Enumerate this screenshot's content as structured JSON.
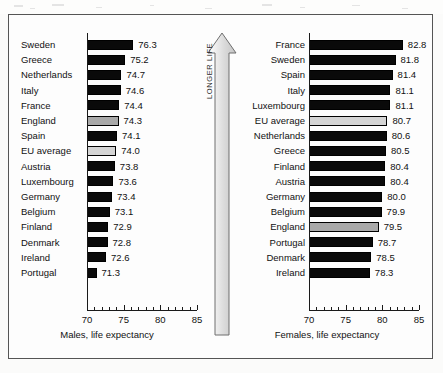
{
  "chart_data": [
    {
      "type": "bar",
      "orientation": "horizontal",
      "title": "",
      "xlabel": "Males, life expectancy",
      "ylabel": "",
      "xlim": [
        70,
        85
      ],
      "xticks": [
        70,
        75,
        80,
        85
      ],
      "minor_tick_step": 1,
      "grid": false,
      "legend": "none",
      "categories": [
        "Sweden",
        "Greece",
        "Netherlands",
        "Italy",
        "France",
        "England",
        "Spain",
        "EU average",
        "Austria",
        "Luxembourg",
        "Germany",
        "Belgium",
        "Finland",
        "Denmark",
        "Ireland",
        "Portugal"
      ],
      "values": [
        76.3,
        75.2,
        74.7,
        74.6,
        74.4,
        74.3,
        74.1,
        74.0,
        73.8,
        73.6,
        73.4,
        73.1,
        72.9,
        72.8,
        72.6,
        71.3
      ],
      "value_labels": [
        "76.3",
        "75.2",
        "74.7",
        "74.6",
        "74.4",
        "74.3",
        "74.1",
        "74.0",
        "73.8",
        "73.6",
        "73.4",
        "73.1",
        "72.9",
        "72.8",
        "72.6",
        "71.3"
      ],
      "highlights": {
        "England": "england",
        "EU average": "eu"
      }
    },
    {
      "type": "bar",
      "orientation": "horizontal",
      "title": "",
      "xlabel": "Females, life expectancy",
      "ylabel": "",
      "xlim": [
        70,
        85
      ],
      "xticks": [
        70,
        75,
        80,
        85
      ],
      "minor_tick_step": 1,
      "grid": false,
      "legend": "none",
      "categories": [
        "France",
        "Sweden",
        "Spain",
        "Italy",
        "Luxembourg",
        "EU average",
        "Netherlands",
        "Greece",
        "Finland",
        "Austria",
        "Germany",
        "Belgium",
        "England",
        "Portugal",
        "Denmark",
        "Ireland"
      ],
      "values": [
        82.8,
        81.8,
        81.4,
        81.1,
        81.1,
        80.7,
        80.6,
        80.5,
        80.4,
        80.4,
        80.0,
        79.9,
        79.5,
        78.7,
        78.5,
        78.3
      ],
      "value_labels": [
        "82.8",
        "81.8",
        "81.4",
        "81.1",
        "81.1",
        "80.7",
        "80.6",
        "80.5",
        "80.4",
        "80.4",
        "80.0",
        "79.9",
        "79.5",
        "78.7",
        "78.5",
        "78.3"
      ],
      "highlights": {
        "England": "england",
        "EU average": "eu"
      }
    }
  ],
  "annotation": {
    "arrow_label": "LONGER LIFE"
  },
  "colors": {
    "bar_default": "#0a0a0a",
    "bar_england": "#a9a9a9",
    "bar_eu_average": "#d4d4d4",
    "axis": "#1a1a1a",
    "frame": "#555555",
    "text": "#111111"
  }
}
